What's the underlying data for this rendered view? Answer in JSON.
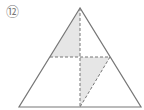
{
  "figure": {
    "number_label": "⑫",
    "colors": {
      "stroke": "#777777",
      "shade": "#e6e6e6",
      "background": "#ffffff"
    },
    "triangle": {
      "apex": [
        80,
        8
      ],
      "base_left": [
        19,
        107
      ],
      "base_right": [
        141,
        107
      ]
    },
    "midline": {
      "from": [
        50,
        57
      ],
      "to": [
        110,
        57
      ],
      "style": "dashed"
    },
    "center_line": {
      "from": [
        80,
        8
      ],
      "to": [
        80,
        107
      ],
      "style": "dashed"
    },
    "diagonal": {
      "from": [
        110,
        57
      ],
      "to": [
        80,
        107
      ],
      "style": "dashed"
    },
    "shaded_regions": [
      {
        "name": "upper-left-shaded",
        "points": [
          [
            80,
            8
          ],
          [
            50,
            57
          ],
          [
            80,
            57
          ]
        ]
      },
      {
        "name": "lower-shaded",
        "points": [
          [
            80,
            57
          ],
          [
            110,
            57
          ],
          [
            80,
            107
          ]
        ]
      }
    ]
  }
}
